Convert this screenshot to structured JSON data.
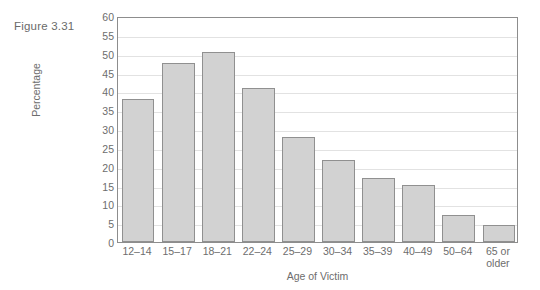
{
  "figure": {
    "caption": "Figure 3.31"
  },
  "chart_data": {
    "type": "bar",
    "title": "",
    "xlabel": "Age of Victim",
    "ylabel": "Percentage",
    "categories": [
      "12–14",
      "15–17",
      "18–21",
      "22–24",
      "25–29",
      "30–34",
      "35–39",
      "40–49",
      "50–64",
      "65 or older"
    ],
    "category_lines": [
      [
        "12–14"
      ],
      [
        "15–17"
      ],
      [
        "18–21"
      ],
      [
        "22–24"
      ],
      [
        "25–29"
      ],
      [
        "30–34"
      ],
      [
        "35–39"
      ],
      [
        "40–49"
      ],
      [
        "50–64"
      ],
      [
        "65 or",
        "older"
      ]
    ],
    "values": [
      38,
      47.5,
      50.5,
      41,
      28,
      21.8,
      17,
      15.1,
      7.1,
      4.4
    ],
    "ylim": [
      0,
      60
    ],
    "yticks": [
      0,
      5,
      10,
      15,
      20,
      25,
      30,
      35,
      40,
      45,
      50,
      55,
      60
    ],
    "ytick_labels": [
      "0",
      "5",
      "10",
      "15",
      "20",
      "25",
      "30",
      "35",
      "40",
      "45",
      "50",
      "55",
      "60"
    ],
    "grid": true,
    "legend": false,
    "bar_fill": "#d2d2d2",
    "bar_border": "#909090",
    "frame_color": "#8d8d8d",
    "gridline_color": "#e2e2e2"
  }
}
